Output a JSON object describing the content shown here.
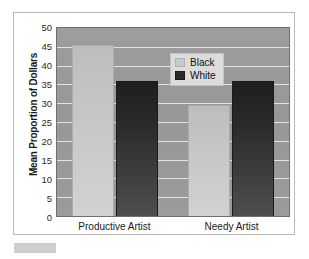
{
  "chart_data": {
    "type": "bar",
    "title": "",
    "subtitle": "",
    "xlabel": "",
    "ylabel": "Mean Proportion of Dollars",
    "categories": [
      "Productive Artist",
      "Needy Artist"
    ],
    "series": [
      {
        "name": "Black",
        "values": [
          45.5,
          29.5
        ],
        "color": "#c6c6c6"
      },
      {
        "name": "White",
        "values": [
          36.0,
          36.0
        ],
        "color": "#2c2c2c"
      }
    ],
    "ylim": [
      0,
      50
    ],
    "yticks": [
      0,
      5,
      10,
      15,
      20,
      25,
      30,
      35,
      40,
      45,
      50
    ],
    "ytick_labels": [
      "0",
      "5",
      "10",
      "15",
      "20",
      "25",
      "30",
      "35",
      "40",
      "45",
      "50"
    ],
    "grid": true,
    "grid_axis": "y",
    "legend_position": "upper-center",
    "legend_entries": [
      "Black",
      "White"
    ],
    "plot_background": "#9a9a9a",
    "gridline_color": "#e9e9e9",
    "figure_background": "#ffffff"
  },
  "legend": {
    "items": [
      {
        "label": "Black",
        "swatch": "light-swatch-icon"
      },
      {
        "label": "White",
        "swatch": "dark-swatch-icon"
      }
    ]
  },
  "axes": {
    "y_title": "Mean Proportion of Dollars",
    "y_ticks": [
      "50",
      "45",
      "40",
      "35",
      "30",
      "25",
      "20",
      "15",
      "10",
      "5",
      "0"
    ],
    "x_categories": [
      "Productive Artist",
      "Needy Artist"
    ]
  }
}
